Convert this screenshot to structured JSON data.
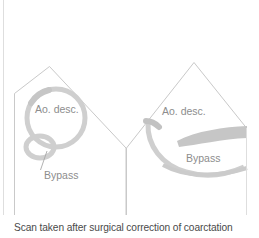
{
  "figure": {
    "caption": "Scan taken after surgical correction of coarctation",
    "background_color": "#ffffff",
    "panels": [
      {
        "id": "left-panel",
        "view": "short-axis",
        "labels": [
          {
            "name": "aorta-descendens-label",
            "text": "Ao. desc.",
            "x": 35,
            "y": 110
          },
          {
            "name": "bypass-label",
            "text": "Bypass",
            "x": 44,
            "y": 176
          }
        ],
        "structures": [
          {
            "name": "aorta-descendens-ring",
            "shape": "circle",
            "color": "#cfcfcf"
          },
          {
            "name": "bypass-graft-ring",
            "shape": "ellipse",
            "color": "#cfcfcf"
          }
        ],
        "leader_line": {
          "name": "bypass-leader-line",
          "from_x": 40,
          "from_y": 172,
          "to_x": 47,
          "to_y": 152
        }
      },
      {
        "id": "right-panel",
        "view": "long-axis",
        "labels": [
          {
            "name": "aorta-descendens-label",
            "text": "Ao. desc.",
            "x": 162,
            "y": 112
          },
          {
            "name": "bypass-label",
            "text": "Bypass",
            "x": 186,
            "y": 159
          }
        ],
        "structures": [
          {
            "name": "aorta-wall-arc",
            "shape": "arc",
            "color": "#cfcfcf"
          },
          {
            "name": "bypass-graft-band",
            "shape": "lens-band",
            "color": "#c6c6c6"
          },
          {
            "name": "bypass-lower-wall",
            "shape": "arc-band",
            "color": "#cbcbcb"
          }
        ]
      }
    ],
    "sector_outline_color": "#c9c9c9",
    "tissue_color": "#cfcfcf",
    "caption_color": "#4a4a4a",
    "label_color": "#8d8d8d"
  }
}
